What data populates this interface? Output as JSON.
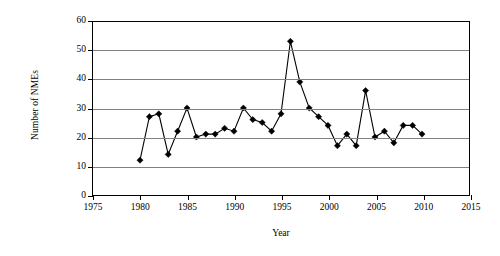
{
  "chart_data": {
    "type": "line",
    "title": "",
    "xlabel": "Year",
    "ylabel": "Number of NMEs",
    "xlim": [
      1975,
      2015
    ],
    "ylim": [
      0,
      60
    ],
    "xticks": [
      1975,
      1980,
      1985,
      1990,
      1995,
      2000,
      2005,
      2010,
      2015
    ],
    "yticks": [
      0,
      10,
      20,
      30,
      40,
      50,
      60
    ],
    "xtick_labels": [
      "1975",
      "1980",
      "1985",
      "1990",
      "1995",
      "2000",
      "2005",
      "2010",
      "2015"
    ],
    "ytick_labels": [
      "0",
      "10",
      "20",
      "30",
      "40",
      "50",
      "60"
    ],
    "grid": "horizontal",
    "legend": "none",
    "marker": "diamond",
    "line_color": "#000000",
    "grid_color": "#808080",
    "x": [
      1980,
      1981,
      1982,
      1983,
      1984,
      1985,
      1986,
      1987,
      1988,
      1989,
      1990,
      1991,
      1992,
      1993,
      1994,
      1995,
      1996,
      1997,
      1998,
      1999,
      2000,
      2001,
      2002,
      2003,
      2004,
      2005,
      2006,
      2007,
      2008,
      2009,
      2010
    ],
    "values": [
      12,
      27,
      28,
      14,
      22,
      30,
      20,
      21,
      21,
      23,
      22,
      30,
      26,
      25,
      22,
      28,
      53,
      39,
      30,
      27,
      24,
      17,
      21,
      17,
      36,
      20,
      22,
      18,
      24,
      24,
      21
    ],
    "series": [
      {
        "name": "Number of NMEs",
        "values": [
          12,
          27,
          28,
          14,
          22,
          30,
          20,
          21,
          21,
          23,
          22,
          30,
          26,
          25,
          22,
          28,
          53,
          39,
          30,
          27,
          24,
          17,
          21,
          17,
          36,
          20,
          22,
          18,
          24,
          24,
          21
        ]
      }
    ]
  }
}
